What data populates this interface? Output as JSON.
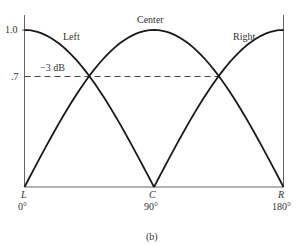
{
  "chart_data": {
    "type": "line",
    "title": "",
    "caption": "(b)",
    "xlabel": "",
    "ylabel": "",
    "x_ticks": [
      {
        "label": "L",
        "sub": "0°",
        "value": 0
      },
      {
        "label": "C",
        "sub": "90°",
        "value": 90
      },
      {
        "label": "R",
        "sub": "180°",
        "value": 180
      }
    ],
    "y_ticks": [
      {
        "label": "1.0",
        "value": 1.0
      },
      {
        "label": ".7",
        "value": 0.707
      }
    ],
    "xlim": [
      0,
      180
    ],
    "ylim": [
      0,
      1.0
    ],
    "grid": false,
    "annotations": [
      {
        "text": "−3 dB",
        "y": 0.707,
        "style": "dashed horizontal line from 0° to 135°"
      }
    ],
    "series": [
      {
        "name": "Left",
        "x": [
          0,
          22.5,
          45,
          67.5,
          90
        ],
        "values": [
          1.0,
          0.92,
          0.707,
          0.38,
          0.0
        ]
      },
      {
        "name": "Center",
        "x": [
          0,
          45,
          90,
          135,
          180
        ],
        "values": [
          0.0,
          0.707,
          1.0,
          0.707,
          0.0
        ]
      },
      {
        "name": "Right",
        "x": [
          90,
          112.5,
          135,
          157.5,
          180
        ],
        "values": [
          0.0,
          0.38,
          0.707,
          0.92,
          1.0
        ]
      }
    ]
  },
  "labels": {
    "y_1": "1.0",
    "y_07": ".7",
    "db": "−3 dB",
    "left": "Left",
    "center": "Center",
    "right": "Right",
    "L": "L",
    "C": "C",
    "R": "R",
    "deg0": "0°",
    "deg90": "90°",
    "deg180": "180°",
    "caption": "(b)"
  }
}
